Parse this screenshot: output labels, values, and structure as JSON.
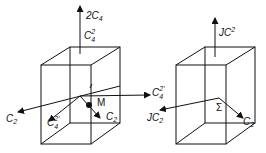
{
  "figure": {
    "left_prism": {
      "labels": {
        "top_axis_upper": {
          "prefix": "2C",
          "sub": "4"
        },
        "top_axis_lower": {
          "base": "C",
          "sup": "2",
          "sub": "4"
        },
        "right_axis": {
          "base": "C",
          "sup": "2'",
          "sub": "4"
        },
        "left_axis": {
          "base": "C",
          "sub": "2"
        },
        "front_axis": {
          "base": "C",
          "sup": "2'",
          "sub": "4"
        },
        "diag_axis": {
          "base": "C",
          "sub": "2"
        },
        "point": "M"
      }
    },
    "right_prism": {
      "labels": {
        "top_axis": {
          "base": "JC",
          "sup": "2"
        },
        "left_axis": {
          "base": "JC",
          "sub": "2"
        },
        "diag_axis": {
          "base": "C",
          "sub": "2"
        },
        "point": "Σ"
      }
    }
  },
  "colors": {
    "ink": "#111111",
    "background": "#ffffff"
  }
}
